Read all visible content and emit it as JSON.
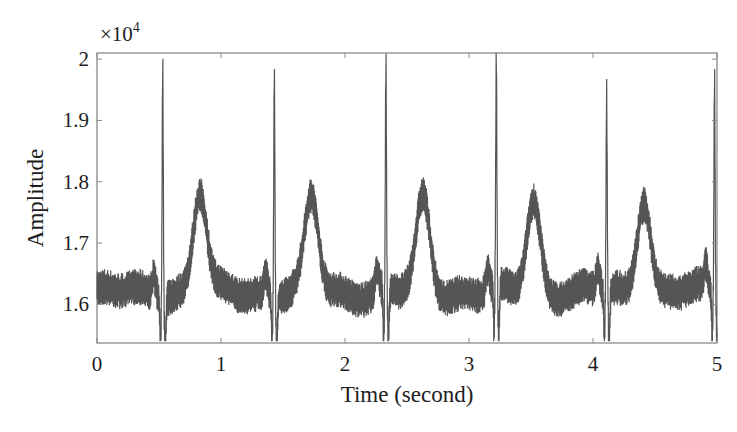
{
  "chart_data": {
    "type": "line",
    "title": "",
    "xlabel": "Time (second)",
    "ylabel": "Amplitude",
    "y_multiplier_label": "×10",
    "y_multiplier_exp": "4",
    "xlim": [
      0,
      5
    ],
    "ylim": [
      1.537,
      2.01
    ],
    "x_ticks": [
      0,
      1,
      2,
      3,
      4,
      5
    ],
    "x_tick_labels": [
      "0",
      "1",
      "2",
      "3",
      "4",
      "5"
    ],
    "y_ticks": [
      1.6,
      1.7,
      1.8,
      1.9,
      2.0
    ],
    "y_tick_labels": [
      "1.6",
      "1.7",
      "1.8",
      "1.9",
      "2"
    ],
    "grid": false,
    "legend": null,
    "line_color": "#555555",
    "series": [
      {
        "name": "ECG signal (×10^4)",
        "description": "Noisy ECG with baseline ~1.62, high-frequency noise ±0.03, R-peaks near 2.0, T-waves ~1.79",
        "baseline": 1.62,
        "noise_amplitude": 0.03,
        "r_peaks": [
          {
            "t": 0.53,
            "amp": 2.0
          },
          {
            "t": 1.43,
            "amp": 1.99
          },
          {
            "t": 2.33,
            "amp": 1.99
          },
          {
            "t": 3.22,
            "amp": 2.0
          },
          {
            "t": 4.11,
            "amp": 1.945
          },
          {
            "t": 4.98,
            "amp": 1.975
          }
        ],
        "t_waves": [
          {
            "t": 0.83,
            "amp": 1.79
          },
          {
            "t": 1.73,
            "amp": 1.78
          },
          {
            "t": 2.63,
            "amp": 1.78
          },
          {
            "t": 3.52,
            "amp": 1.78
          },
          {
            "t": 4.41,
            "amp": 1.785
          }
        ],
        "s_troughs_amp": 1.545
      }
    ]
  }
}
